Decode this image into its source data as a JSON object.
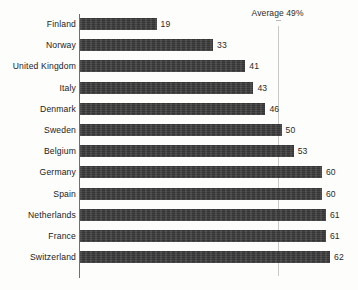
{
  "chart_data": {
    "type": "bar",
    "orientation": "horizontal",
    "title": "",
    "xlabel": "",
    "ylabel": "",
    "grid": false,
    "legend": null,
    "xlim": [
      0,
      62
    ],
    "categories": [
      "Finland",
      "Norway",
      "United Kingdom",
      "Italy",
      "Denmark",
      "Sweden",
      "Belgium",
      "Germany",
      "Spain",
      "Netherlands",
      "France",
      "Switzerland"
    ],
    "values": [
      19,
      33,
      41,
      43,
      46,
      50,
      53,
      60,
      60,
      61,
      61,
      62
    ],
    "value_labels": [
      "19",
      "33",
      "41",
      "43",
      "46",
      "50",
      "53",
      "60",
      "60",
      "61",
      "61",
      "62"
    ],
    "annotations": [
      {
        "name": "average-reference",
        "label": "Average 49%",
        "value": 49
      }
    ]
  },
  "style": {
    "bar_color": "#3b3b3b",
    "axis_color": "#6f6f6f",
    "reference_line_color": "#c9c9c9",
    "text_color": "#222222",
    "background": "#fdfdfc"
  }
}
